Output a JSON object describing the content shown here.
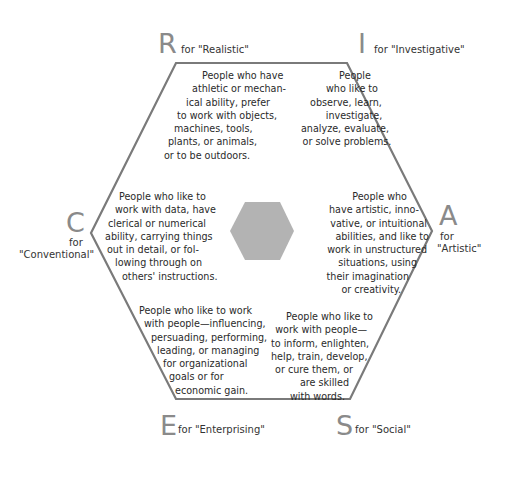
{
  "diagram": {
    "colors": {
      "outline": "#7a7a7a",
      "center_hexagon": "#b3b3b3",
      "letter": "#8a8a8a",
      "text": "#2a2a2a"
    },
    "types": {
      "R": {
        "letter": "R",
        "label": "for \"Realistic\"",
        "lines": [
          "People who have",
          "athletic or mechan-",
          "ical ability, prefer",
          "to work with objects,",
          "machines, tools,",
          "plants, or animals,",
          "or to be outdoors."
        ]
      },
      "I": {
        "letter": "I",
        "label": "for \"Investigative\"",
        "lines": [
          "People",
          "who like to",
          "observe, learn,",
          "investigate,",
          "analyze, evaluate,",
          "or solve problems."
        ]
      },
      "A": {
        "letter": "A",
        "label_for": "for",
        "label_name": "\"Artistic\"",
        "lines": [
          "People who",
          "have artistic, inno-",
          "vative, or intuitional",
          "abilities, and like to",
          "work in unstructured",
          "situations, using",
          "their imagination",
          "or creativity."
        ]
      },
      "S": {
        "letter": "S",
        "label": "for \"Social\"",
        "lines": [
          "People who like to",
          "work with people—",
          "to inform, enlighten,",
          "help, train, develop,",
          "or cure them, or",
          "are skilled",
          "with words."
        ]
      },
      "E": {
        "letter": "E",
        "label": "for \"Enterprising\"",
        "lines": [
          "People who like to work",
          "with people—influencing,",
          "persuading, performing,",
          "leading, or managing",
          "for organizational",
          "goals or for",
          "economic gain."
        ]
      },
      "C": {
        "letter": "C",
        "label_for": "for",
        "label_name": "\"Conventional\"",
        "lines": [
          "People who like to",
          "work with data, have",
          "clerical or numerical",
          "ability, carrying things",
          "out in detail, or fol-",
          "lowing through on",
          "others' instructions."
        ]
      }
    }
  }
}
